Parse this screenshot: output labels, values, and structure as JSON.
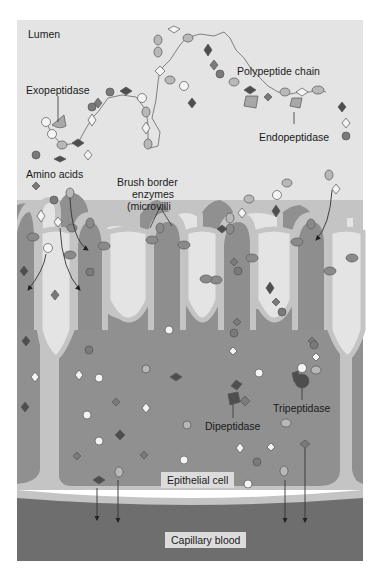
{
  "diagram": {
    "regions": {
      "lumen": "Lumen",
      "epithelial_cell": "Epithelial cell",
      "capillary_blood": "Capillary blood"
    },
    "labels": {
      "exopeptidase": "Exopeptidase",
      "polypeptide_chain": "Polypeptide chain",
      "endopeptidase": "Endopeptidase",
      "amino_acids": "Amino acids",
      "brush_border_line1": "Brush border",
      "brush_border_line2": "enzymes",
      "brush_border_line3": "(microvilli",
      "dipeptidase": "Dipeptidase",
      "tripeptidase": "Tripeptidase"
    },
    "colors": {
      "lumen": "#e4e4e4",
      "villus_border": "#c4c4c4",
      "villus_core": "#8e8e8e",
      "cell_body": "#909090",
      "capillary": "#6e6e6e",
      "enzyme": "#8a8a8a",
      "amino_dark": "#4e4e4e",
      "amino_mid": "#7a7a7a",
      "amino_light": "#b8b8b8",
      "amino_white": "#f4f4f4"
    }
  }
}
